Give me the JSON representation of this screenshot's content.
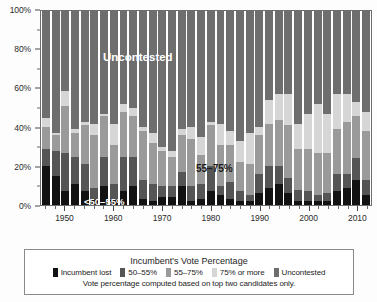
{
  "chart_data": {
    "type": "bar",
    "subtype": "stacked-percentage",
    "title": "",
    "xlabel": "",
    "ylabel": "",
    "ylim": [
      0,
      100
    ],
    "y_ticks_major": [
      0,
      20,
      40,
      60,
      80,
      100
    ],
    "y_tick_labels": [
      "0%",
      "20%",
      "40%",
      "60%",
      "80%",
      "100%"
    ],
    "y_ticks_minor": [
      10,
      30,
      50,
      70,
      90
    ],
    "xlim": [
      1945,
      2013
    ],
    "x_ticks_major": [
      1950,
      1960,
      1970,
      1980,
      1990,
      2000,
      2010
    ],
    "x_tick_labels": [
      "1950",
      "1960",
      "1970",
      "1980",
      "1990",
      "2000",
      "2010"
    ],
    "grid": false,
    "legend_position": "below-plot",
    "categories": [
      1946,
      1948,
      1950,
      1952,
      1954,
      1956,
      1958,
      1960,
      1962,
      1964,
      1966,
      1968,
      1970,
      1972,
      1974,
      1976,
      1978,
      1980,
      1982,
      1984,
      1986,
      1988,
      1990,
      1992,
      1994,
      1996,
      1998,
      2000,
      2002,
      2004,
      2006,
      2008,
      2010,
      2012
    ],
    "series": [
      {
        "name": "Incumbent lost",
        "color": "#121212",
        "values": [
          20,
          15,
          7,
          11,
          7,
          3,
          10,
          3,
          7,
          10,
          3,
          2,
          4,
          4,
          10,
          2,
          3,
          7,
          5,
          3,
          2,
          2,
          6,
          9,
          11,
          6,
          2,
          2,
          2,
          2,
          7,
          9,
          13,
          5
        ]
      },
      {
        "name": "50–55%",
        "color": "#555555",
        "values": [
          9,
          13,
          20,
          14,
          14,
          6,
          15,
          8,
          18,
          15,
          10,
          9,
          6,
          6,
          7,
          8,
          8,
          13,
          5,
          9,
          5,
          3,
          10,
          11,
          9,
          8,
          6,
          5,
          3,
          4,
          9,
          7,
          11,
          8
        ]
      },
      {
        "name": "55–75%",
        "color": "#9a9a9a",
        "values": [
          11,
          8,
          24,
          12,
          20,
          27,
          21,
          20,
          23,
          21,
          25,
          21,
          18,
          15,
          19,
          24,
          15,
          21,
          21,
          19,
          15,
          16,
          20,
          22,
          24,
          27,
          21,
          22,
          22,
          21,
          23,
          27,
          22,
          25
        ]
      },
      {
        "name": "75% or more",
        "color": "#d6d6d6",
        "values": [
          5,
          1,
          8,
          2,
          2,
          6,
          1,
          11,
          4,
          4,
          2,
          5,
          2,
          3,
          3,
          6,
          9,
          2,
          11,
          7,
          11,
          16,
          4,
          12,
          13,
          16,
          13,
          18,
          25,
          20,
          18,
          14,
          7,
          10
        ]
      },
      {
        "name": "Uncontested",
        "color": "#6e6e6e",
        "values": [
          55,
          63,
          41,
          61,
          57,
          58,
          53,
          58,
          48,
          50,
          60,
          63,
          70,
          72,
          61,
          60,
          65,
          57,
          58,
          62,
          67,
          63,
          60,
          46,
          43,
          43,
          58,
          53,
          48,
          53,
          43,
          43,
          47,
          52
        ]
      }
    ],
    "annotations": [
      {
        "id": "uncontested",
        "text": "Uncontested"
      },
      {
        "id": "band_55_75",
        "text": "55–75%"
      },
      {
        "id": "band_50_55",
        "text": "<50–55%"
      }
    ]
  },
  "legend": {
    "title": "Incumbent's Vote Percentage",
    "items": [
      {
        "label": "Incumbent lost",
        "color": "#121212"
      },
      {
        "label": "50–55%",
        "color": "#555555"
      },
      {
        "label": "55–75%",
        "color": "#9a9a9a"
      },
      {
        "label": "75% or more",
        "color": "#d6d6d6"
      },
      {
        "label": "Uncontested",
        "color": "#6e6e6e"
      }
    ],
    "note": "Vote percentage computed based on top two candidates only."
  }
}
